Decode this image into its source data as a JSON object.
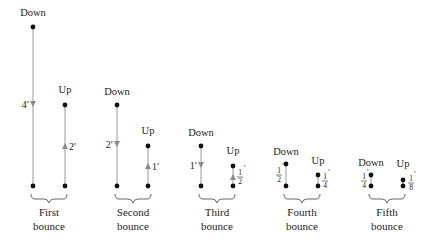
{
  "colors": {
    "line": "#9a9a9a",
    "arrow": "#8a8a8a",
    "dot": "#111111",
    "text": "#222222",
    "brace": "#555555"
  },
  "labels": {
    "down": "Down",
    "up": "Up",
    "bounce": "bounce"
  },
  "bounces": [
    {
      "name": "First",
      "down_distance": "4′",
      "up_distance": "2′",
      "down_x": 33,
      "up_x": 65,
      "down_top_y": 27,
      "up_top_y": 105,
      "down_label_y": 16,
      "up_label_y": 93
    },
    {
      "name": "Second",
      "down_distance": "2′",
      "up_distance": "1′",
      "down_x": 117,
      "up_x": 148,
      "down_top_y": 105,
      "up_top_y": 146,
      "down_label_y": 94,
      "up_label_y": 135
    },
    {
      "name": "Third",
      "down_distance": "1′",
      "up_distance": "1/2′",
      "up_num": "1",
      "up_den": "2",
      "down_x": 201,
      "up_x": 233,
      "down_top_y": 146,
      "up_top_y": 166,
      "down_label_y": 135,
      "up_label_y": 154
    },
    {
      "name": "Fourth",
      "down_distance": "1/2′",
      "down_num": "1",
      "down_den": "2",
      "up_distance": "1/4′",
      "up_num": "1",
      "up_den": "4",
      "down_x": 286,
      "up_x": 318,
      "down_top_y": 164,
      "up_top_y": 175,
      "down_label_y": 154,
      "up_label_y": 163
    },
    {
      "name": "Fifth",
      "down_distance": "1/4′",
      "down_num": "1",
      "down_den": "4",
      "up_distance": "1/8′",
      "up_num": "1",
      "up_den": "8",
      "down_x": 371,
      "up_x": 403,
      "down_top_y": 175,
      "up_top_y": 180,
      "down_label_y": 164,
      "up_label_y": 166
    }
  ],
  "ground_y": 186
}
